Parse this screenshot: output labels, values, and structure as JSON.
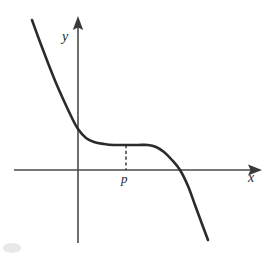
{
  "figure": {
    "kind": "cartesian-graph",
    "background_color": "#ffffff",
    "axes": {
      "x_axis": {
        "label": "x",
        "color": "#4a4a4a",
        "start_px": [
          14,
          170
        ],
        "end_px": [
          262,
          170
        ],
        "arrow_at": "right"
      },
      "y_axis": {
        "label": "y",
        "color": "#4a4a4a",
        "start_px": [
          78,
          243
        ],
        "end_px": [
          78,
          16
        ],
        "arrow_at": "top"
      },
      "origin_px": [
        78,
        170
      ]
    },
    "annotations": [
      {
        "name": "p-marker",
        "label": "p",
        "x_px": 126,
        "dashed_guide_from_px": [
          126,
          145
        ],
        "dashed_guide_to_px": [
          126,
          170
        ],
        "color": "#3a3a3a"
      }
    ]
  },
  "chart_data": {
    "type": "line",
    "title": "",
    "xlabel": "x",
    "ylabel": "y",
    "grid": false,
    "legend": null,
    "annotations": [
      "p"
    ],
    "series": [
      {
        "name": "curve",
        "color": "#2b2b2b",
        "points_px": [
          [
            32,
            20
          ],
          [
            40,
            42
          ],
          [
            48,
            63
          ],
          [
            56,
            83
          ],
          [
            64,
            101
          ],
          [
            72,
            118
          ],
          [
            78,
            129
          ],
          [
            86,
            138
          ],
          [
            94,
            142
          ],
          [
            104,
            144
          ],
          [
            114,
            145
          ],
          [
            126,
            145
          ],
          [
            138,
            145
          ],
          [
            148,
            145
          ],
          [
            156,
            147
          ],
          [
            164,
            152
          ],
          [
            172,
            160
          ],
          [
            180,
            170
          ],
          [
            188,
            186
          ],
          [
            195,
            205
          ],
          [
            202,
            224
          ],
          [
            208,
            240
          ]
        ]
      }
    ]
  }
}
